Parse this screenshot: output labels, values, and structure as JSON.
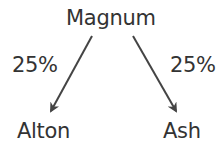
{
  "diagram": {
    "type": "tree",
    "root": {
      "label": "Magnum"
    },
    "children": [
      {
        "label": "Alton",
        "edge_label": "25%"
      },
      {
        "label": "Ash",
        "edge_label": "25%"
      }
    ],
    "colors": {
      "text": "#333333",
      "arrow": "#444444",
      "background": "#ffffff"
    }
  }
}
